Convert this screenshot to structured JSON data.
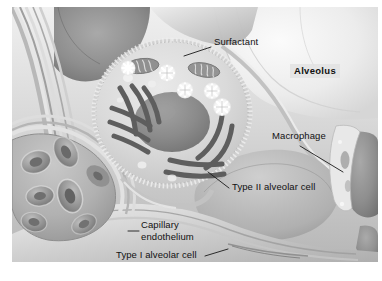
{
  "figure": {
    "type": "biological-illustration",
    "style": "grayscale airbrush histology art",
    "dimensions": {
      "width": 382,
      "height": 281
    },
    "margins": {
      "left": 12,
      "top": 7,
      "right": 4,
      "bottom": 19
    }
  },
  "palette": {
    "page_background": "#ffffff",
    "alveolar_air_space_light": "#efefef",
    "alveolar_air_space_mid": "#d8d8d8",
    "alveolar_air_space_dark": "#8e8e8e",
    "septum_tissue": "#c9c9c9",
    "septum_tissue_light": "#e4e4e4",
    "type2_cytoplasm": "#dcdcdc",
    "type2_nucleus": "#8a8a8a",
    "organelle_dark": "#5e5e5e",
    "lamellar_body_white": "#fdfdfd",
    "erythrocyte_mid": "#9a9a9a",
    "erythrocyte_dark": "#6f6f6f",
    "capillary_lumen": "#b4b4b4",
    "leader_line": "#1a1a1a",
    "label_ink": "#111111",
    "label_box_fill": "#e2e2e2"
  },
  "labels": [
    {
      "id": "surfactant",
      "text": "Surfactant",
      "x": 214,
      "y": 41,
      "bold": false,
      "boxed": false,
      "leader": {
        "x1": 211,
        "y1": 47,
        "x2": 184,
        "y2": 56
      }
    },
    {
      "id": "alveolus",
      "text": "Alveolus",
      "x": 290,
      "y": 70,
      "bold": true,
      "boxed": true,
      "leader": null
    },
    {
      "id": "macrophage",
      "text": "Macrophage",
      "x": 272,
      "y": 135,
      "bold": false,
      "boxed": false,
      "leader": {
        "x1": 300,
        "y1": 146,
        "x2": 343,
        "y2": 172
      }
    },
    {
      "id": "type-ii-alveolar-cell",
      "text": "Type II alveolar cell",
      "x": 232,
      "y": 186,
      "bold": false,
      "boxed": false,
      "leader": {
        "x1": 229,
        "y1": 188,
        "x2": 208,
        "y2": 172
      }
    },
    {
      "id": "capillary-endothelium",
      "text": "Capillary\nendothelium",
      "x": 141,
      "y": 226,
      "bold": false,
      "boxed": false,
      "leader": {
        "x1": 139,
        "y1": 231,
        "x2": 128,
        "y2": 231
      }
    },
    {
      "id": "type-i-alveolar-cell",
      "text": "Type I alveolar cell",
      "x": 116,
      "y": 254,
      "bold": false,
      "boxed": false,
      "leader": {
        "x1": 205,
        "y1": 256,
        "x2": 228,
        "y2": 249
      }
    }
  ],
  "structures": {
    "type_ii_cell": {
      "name": "Type II alveolar cell",
      "center": {
        "x": 172,
        "y": 113
      },
      "radius_x": 78,
      "radius_y": 72,
      "nucleus": {
        "x": 172,
        "y": 122,
        "rx": 37,
        "ry": 30
      },
      "mitochondria_count": 2,
      "lamellar_bodies_count": 5,
      "golgi_stacks": 2
    },
    "capillary": {
      "name": "Capillary",
      "center": {
        "x": 58,
        "y": 185
      },
      "erythrocyte_count": 7
    },
    "alveolar_spaces": [
      {
        "id": "upper-left-space",
        "tone": "dark"
      },
      {
        "id": "upper-right-space",
        "tone": "light"
      },
      {
        "id": "lower-right-space",
        "tone": "dark"
      },
      {
        "id": "far-right-space",
        "tone": "dark"
      }
    ]
  }
}
